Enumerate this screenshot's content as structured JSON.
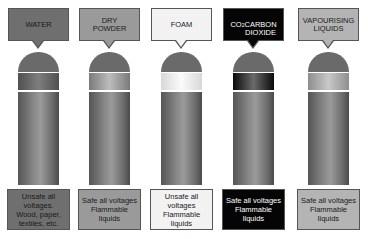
{
  "extinguishers": [
    {
      "name": "WATER",
      "label_lines": "WATER",
      "color": "#6f6f6f",
      "text_color": "#1a1a1a",
      "band_gradient": [
        "#505050",
        "#7e7e7e",
        "#505050"
      ],
      "info": "Unsafe all\nvoltages.\nWood, paper,\ntextiles, etc."
    },
    {
      "name": "DRY POWDER",
      "label_lines": "DRY\nPOWDER",
      "color": "#9a9a9a",
      "text_color": "#1a1a1a",
      "band_gradient": [
        "#7a7a7a",
        "#bcbcbc",
        "#7a7a7a"
      ],
      "info": "Safe all voltages\nFlammable\nliquids"
    },
    {
      "name": "FOAM",
      "label_lines": "FOAM",
      "color": "#f2f2f2",
      "text_color": "#1a1a1a",
      "band_gradient": [
        "#d8d8d8",
        "#fafafa",
        "#d8d8d8"
      ],
      "info": "Unsafe all\nvoltages\nFlammable\nliquids"
    },
    {
      "name": "CO2 CARBON DIOXIDE",
      "label_lines": "CO2\nCARBON\nDIOXIDE",
      "color": "#050505",
      "text_color": "#ffffff",
      "band_gradient": [
        "#0a0a0a",
        "#6a6a6a",
        "#0a0a0a"
      ],
      "info": "Safe all voltages\nFlammable\nliquids"
    },
    {
      "name": "VAPOURISING LIQUIDS",
      "label_lines": "VAPOURISING\nLIQUIDS",
      "color": "#b4b4b4",
      "text_color": "#1a1a1a",
      "band_gradient": [
        "#8e8e8e",
        "#c8c8c8",
        "#8e8e8e"
      ],
      "info": "Safe all voltages\nFlammable\nliquids"
    }
  ],
  "columns_x": [
    8,
    79,
    151,
    223,
    298
  ]
}
